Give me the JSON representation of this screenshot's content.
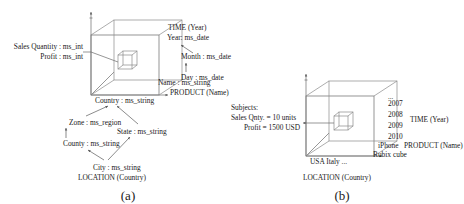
{
  "figure": {
    "caption_a": "(a)",
    "caption_b": "(b)"
  },
  "panel_a": {
    "measures": {
      "line1": "Sales Quantity : ms_int",
      "line2": "Profit : ms_int"
    },
    "time_dimension": {
      "title": "TIME (Year)",
      "level_year": "Year: ms_date",
      "level_month": "Month : ms_date",
      "level_day": "Day : ms_date"
    },
    "product_dimension": {
      "level_name": "Name : ms_string",
      "title": "PRODUCT (Name)"
    },
    "location_dimension": {
      "title": "LOCATION (Country)",
      "level_country": "Country : ms_string",
      "level_zone": "Zone : ms_region",
      "level_state": "State : ms_string",
      "level_county": "County : ms_string",
      "level_city": "City : ms_string"
    }
  },
  "panel_b": {
    "subjects": {
      "heading": "Subjects:",
      "line1": "Sales Qnty. = 10 units",
      "line2": "Profit = 1500 USD"
    },
    "time_axis": {
      "title": "TIME (Year)",
      "ellipsis": "...",
      "ticks": [
        "2007",
        "2008",
        "2009",
        "2010"
      ]
    },
    "product_axis": {
      "title": "PRODUCT (Name)",
      "tick1": "iPhone",
      "tick2": "Rubix cube"
    },
    "location_axis": {
      "title": "LOCATION (Country)",
      "ticks": "USA  Italy ..."
    }
  },
  "colors": {
    "ink": "#1a1a1a",
    "line": "#8a8a8a",
    "background": "#ffffff"
  }
}
